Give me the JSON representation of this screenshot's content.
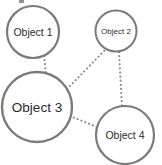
{
  "diagram": {
    "background_color": "#ffffff",
    "node_stroke_color": "#7a7a7a",
    "node_fill_color": "#ffffff",
    "edge_color": "#8a8a8a",
    "edge_style": "dotted",
    "label_color": "#2b2b2b",
    "nodes": [
      {
        "id": "object-1",
        "label": "Object 1",
        "cx": 33,
        "cy": 32,
        "r": 26,
        "stroke_width": 2.2,
        "font_size": 10.5
      },
      {
        "id": "object-2",
        "label": "Object 2",
        "cx": 116,
        "cy": 31,
        "r": 20.5,
        "stroke_width": 2.0,
        "font_size": 8
      },
      {
        "id": "object-3",
        "label": "Object 3",
        "cx": 37,
        "cy": 107,
        "r": 35,
        "stroke_width": 2.4,
        "font_size": 13.5
      },
      {
        "id": "object-4",
        "label": "Object 4",
        "cx": 125,
        "cy": 135,
        "r": 29,
        "stroke_width": 2.2,
        "font_size": 10.5
      }
    ],
    "edges": [
      {
        "id": "edge-1-3",
        "from": "object-1",
        "to": "object-3",
        "x1": 44,
        "y1": 56,
        "x2": 46,
        "y2": 73,
        "width": 2.1
      },
      {
        "id": "edge-3-2",
        "from": "object-3",
        "to": "object-2",
        "x1": 67,
        "y1": 89,
        "x2": 106,
        "y2": 49,
        "width": 2.1
      },
      {
        "id": "edge-2-4",
        "from": "object-2",
        "to": "object-4",
        "x1": 119,
        "y1": 52,
        "x2": 122,
        "y2": 106,
        "width": 2.1
      },
      {
        "id": "edge-3-4",
        "from": "object-3",
        "to": "object-4",
        "x1": 70,
        "y1": 116,
        "x2": 97,
        "y2": 127,
        "width": 2.1
      }
    ],
    "crop_artifact": {
      "present": true,
      "left": 19,
      "top": 0,
      "width": 5,
      "height": 3
    }
  }
}
